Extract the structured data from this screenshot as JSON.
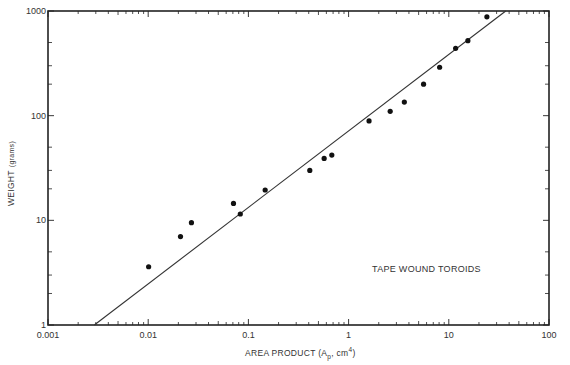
{
  "chart_data": {
    "type": "scatter",
    "title": "",
    "annotation": "TAPE WOUND TOROIDS",
    "xlabel": "AREA PRODUCT (Ap, cm4)",
    "xlabel_parts": {
      "main": "AREA PRODUCT (A",
      "sub": "p",
      "mid": ", cm",
      "sup": "4",
      "end": ")"
    },
    "ylabel": "WEIGHT (grams)",
    "ylabel_parts": {
      "main": "WEIGHT",
      "small": "(grams)"
    },
    "xscale": "log",
    "yscale": "log",
    "xlim": [
      0.001,
      100
    ],
    "ylim": [
      1,
      1000
    ],
    "x_ticks": [
      "0.001",
      "0.01",
      "0.1",
      "1",
      "10",
      "100"
    ],
    "x_tick_values": [
      0.001,
      0.01,
      0.1,
      1,
      10,
      100
    ],
    "y_ticks": [
      "1",
      "10",
      "100",
      "1000"
    ],
    "y_tick_values": [
      1,
      10,
      100,
      1000
    ],
    "grid": false,
    "legend": null,
    "series": [
      {
        "name": "Tape wound toroids (data)",
        "kind": "points",
        "points": [
          [
            0.0101,
            3.6
          ],
          [
            0.021,
            7.0
          ],
          [
            0.027,
            9.5
          ],
          [
            0.071,
            14.5
          ],
          [
            0.083,
            11.5
          ],
          [
            0.147,
            19.5
          ],
          [
            0.41,
            30
          ],
          [
            0.57,
            39
          ],
          [
            0.68,
            42
          ],
          [
            1.6,
            89
          ],
          [
            2.6,
            110
          ],
          [
            3.6,
            135
          ],
          [
            5.6,
            200
          ],
          [
            8.1,
            290
          ],
          [
            11.7,
            440
          ],
          [
            15.5,
            520
          ],
          [
            24,
            880
          ]
        ]
      },
      {
        "name": "Fit line",
        "kind": "line",
        "points": [
          [
            0.0029,
            1.0
          ],
          [
            37,
            1000
          ]
        ]
      }
    ]
  }
}
